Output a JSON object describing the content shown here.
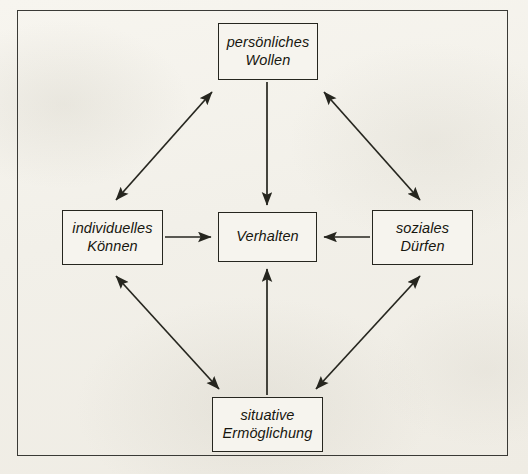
{
  "diagram": {
    "background_color": "#f2f0e9",
    "line_color": "#26261f",
    "nodes": {
      "wollen": {
        "line1": "persönliches",
        "line2": "Wollen"
      },
      "koennen": {
        "line1": "individuelles",
        "line2": "Können"
      },
      "verhalten": {
        "line1": "Verhalten",
        "line2": ""
      },
      "duerfen": {
        "line1": "soziales",
        "line2": "Dürfen"
      },
      "situativ": {
        "line1": "situative",
        "line2": "Ermöglichung"
      }
    },
    "edges": [
      {
        "from": "koennen",
        "to": "wollen",
        "type": "bidirectional"
      },
      {
        "from": "wollen",
        "to": "duerfen",
        "type": "bidirectional"
      },
      {
        "from": "koennen",
        "to": "situativ",
        "type": "bidirectional"
      },
      {
        "from": "situativ",
        "to": "duerfen",
        "type": "bidirectional"
      },
      {
        "from": "wollen",
        "to": "verhalten",
        "type": "unidirectional"
      },
      {
        "from": "koennen",
        "to": "verhalten",
        "type": "unidirectional"
      },
      {
        "from": "duerfen",
        "to": "verhalten",
        "type": "unidirectional"
      },
      {
        "from": "situativ",
        "to": "verhalten",
        "type": "unidirectional"
      }
    ]
  }
}
